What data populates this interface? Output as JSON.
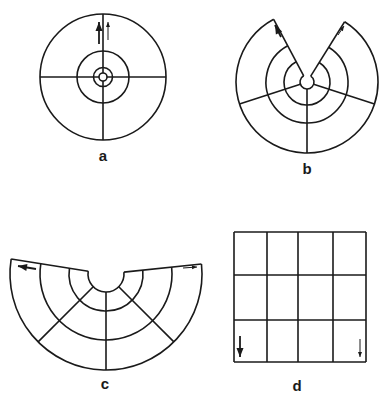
{
  "figure": {
    "stroke_color": "#1a1a1a",
    "background": "#ffffff",
    "panels": [
      {
        "id": "a",
        "label": "a",
        "type": "full-circle",
        "center": [
          103,
          77
        ],
        "rings": [
          4,
          9.5,
          26,
          63
        ],
        "radials_deg": [
          0,
          90,
          180,
          270
        ],
        "arrows": [
          {
            "from": [
              99,
              44
            ],
            "to": [
              99,
              22
            ],
            "size": "large"
          },
          {
            "from": [
              108,
              40
            ],
            "to": [
              108,
              22
            ],
            "size": "small"
          }
        ],
        "label_pos": [
          103,
          155
        ]
      },
      {
        "id": "b",
        "label": "b",
        "type": "sector-cut",
        "center": [
          307,
          82
        ],
        "gap_deg": [
          -118,
          -58
        ],
        "rings": [
          7,
          23,
          41,
          71
        ],
        "radials_deg": [
          18,
          90,
          162
        ],
        "arrows": [
          {
            "from": [
              281,
              37
            ],
            "to": [
              275,
              25
            ],
            "size": "large"
          },
          {
            "from": [
              338,
              35
            ],
            "to": [
              344,
              26
            ],
            "size": "small"
          }
        ],
        "label_pos": [
          307,
          168
        ]
      },
      {
        "id": "c",
        "label": "c",
        "type": "semicircle-fan",
        "center": [
          106,
          274
        ],
        "start_deg": -171,
        "end_deg": -6,
        "rings": [
          18,
          37,
          66,
          96
        ],
        "radials_deg": [
          45,
          90,
          135
        ],
        "arrows": [
          {
            "from": [
              36,
              269
            ],
            "to": [
              18,
              266
            ],
            "size": "large"
          },
          {
            "from": [
              183,
              268
            ],
            "to": [
              197,
              267
            ],
            "size": "small"
          }
        ],
        "label_pos": [
          105,
          383
        ]
      },
      {
        "id": "d",
        "label": "d",
        "type": "grid",
        "x": 234,
        "y": 232,
        "width": 132,
        "height": 130,
        "columns": [
          234,
          267,
          298,
          333,
          366
        ],
        "rows": [
          232,
          275,
          320,
          362
        ],
        "arrows": [
          {
            "from": [
              240,
              336
            ],
            "to": [
              240,
              357
            ],
            "size": "large"
          },
          {
            "from": [
              360,
              339
            ],
            "to": [
              360,
              357
            ],
            "size": "small"
          }
        ],
        "label_pos": [
          297,
          385
        ]
      }
    ]
  }
}
